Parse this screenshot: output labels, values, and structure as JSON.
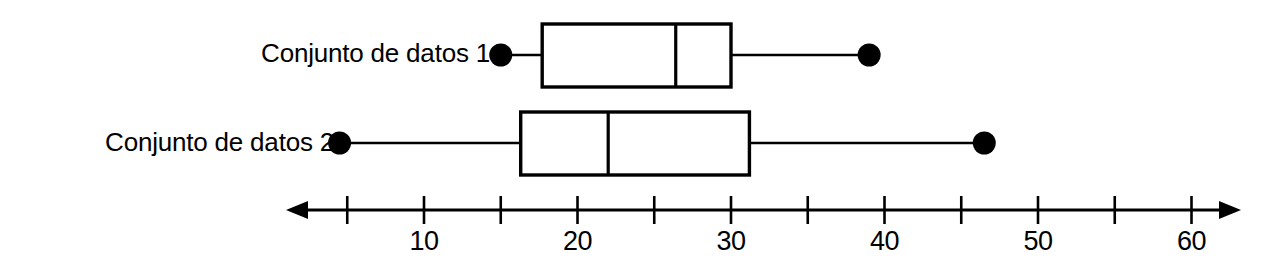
{
  "chart_data": {
    "type": "boxplot",
    "title": "",
    "xlabel": "",
    "ylabel": "",
    "orientation": "horizontal",
    "xlim": [
      2,
      64
    ],
    "grid": false,
    "legend": "none",
    "axis": {
      "tick_step": 5,
      "ticks": [
        5,
        10,
        15,
        20,
        25,
        30,
        35,
        40,
        45,
        50,
        55,
        60
      ],
      "labeled_ticks": [
        10,
        20,
        30,
        40,
        50,
        60
      ],
      "tick_labels": [
        "10",
        "20",
        "30",
        "40",
        "50",
        "60"
      ],
      "arrow_left": true,
      "arrow_right": true
    },
    "series": [
      {
        "name": "Conjunto de datos 1",
        "min": 15,
        "q1": 17.7,
        "median": 26.4,
        "q3": 30,
        "max": 39,
        "whisker_cap": "dot"
      },
      {
        "name": "Conjunto de datos 2",
        "min": 4.5,
        "q1": 16.3,
        "median": 22,
        "q3": 31.2,
        "max": 46.5,
        "whisker_cap": "dot"
      }
    ]
  },
  "labels": {
    "dataset_1": "Conjunto de datos 1",
    "dataset_2": "Conjunto de datos 2"
  },
  "colors": {
    "stroke": "#000000",
    "fill": "#ffffff",
    "background": "#ffffff"
  }
}
